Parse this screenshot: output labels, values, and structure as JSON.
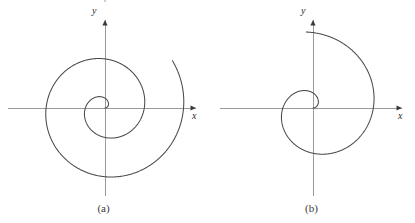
{
  "figure": {
    "background_color": "#ffffff",
    "curve_color": "#4a4a4a",
    "axis_color": "#9a9a9a",
    "text_color": "#2b2b2b",
    "width": 415,
    "height": 223
  },
  "panels": [
    {
      "id": "a",
      "caption": "(a)",
      "axis_x_label": "x",
      "axis_y_label": "y",
      "origin": {
        "x": 105,
        "y": 108
      },
      "axis_x_extent": {
        "start": 8,
        "end": 196
      },
      "axis_y_extent": {
        "start": 20,
        "end": 196
      }
    },
    {
      "id": "b",
      "caption": "(b)",
      "axis_x_label": "x",
      "axis_y_label": "y",
      "origin": {
        "x": 105,
        "y": 108
      },
      "axis_x_extent": {
        "start": 12,
        "end": 194
      },
      "axis_y_extent": {
        "start": 20,
        "end": 196
      }
    }
  ],
  "chart_data": [
    {
      "type": "line",
      "id": "spiral-a",
      "title": "(a)",
      "curve": "archimedean-spiral",
      "polar_equation": "r = aθ",
      "xlabel": "x",
      "ylabel": "y",
      "grid": false,
      "legend": "none",
      "direction": "counterclockwise",
      "theta_start_deg": 0,
      "theta_end_deg": 755,
      "a_pixels_per_radian": 6.25,
      "turns": 2.1,
      "r_max_pixels": 82,
      "start_point": {
        "x": 0,
        "y": 0
      },
      "end_point_pixels": {
        "x": 75,
        "y": -33
      },
      "axis_ranges": {
        "xlim": [
          -97,
          91
        ],
        "ylim": [
          -88,
          88
        ]
      }
    },
    {
      "type": "line",
      "id": "spiral-b",
      "title": "(b)",
      "curve": "archimedean-spiral",
      "polar_equation": "r = aθ",
      "xlabel": "x",
      "ylabel": "y",
      "grid": false,
      "legend": "none",
      "direction": "counterclockwise",
      "theta_start_deg": 0,
      "theta_end_deg": 455,
      "a_pixels_per_radian": 9.6,
      "turns": 1.26,
      "r_max_pixels": 76,
      "start_point": {
        "x": 0,
        "y": 0
      },
      "end_point_pixels": {
        "x": 74,
        "y": 2
      },
      "axis_ranges": {
        "xlim": [
          -93,
          89
        ],
        "ylim": [
          -88,
          88
        ]
      }
    }
  ]
}
